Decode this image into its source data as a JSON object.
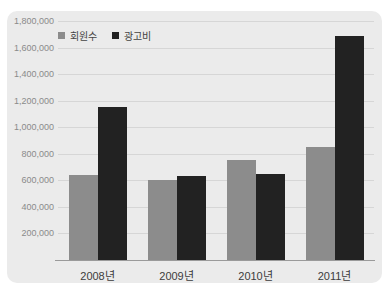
{
  "chart_data": {
    "type": "bar",
    "categories": [
      "2008년",
      "2009년",
      "2010년",
      "2011년"
    ],
    "series": [
      {
        "name": "회원수",
        "color": "#8c8c8c",
        "values": [
          640000,
          600000,
          750000,
          850000
        ]
      },
      {
        "name": "광고비",
        "color": "#222222",
        "values": [
          1150000,
          630000,
          650000,
          1690000
        ]
      }
    ],
    "title": "",
    "xlabel": "",
    "ylabel": "",
    "ylim": [
      0,
      1800000
    ],
    "ytick_interval": 200000,
    "ytick_labels": [
      "1,800,000",
      "1,600,000",
      "1,400,000",
      "1,200,000",
      "1,000,000",
      "800,000",
      "600,000",
      "400,000",
      "200,000"
    ],
    "grid": true,
    "legend_position": "top-left",
    "background_color": "#ebebeb",
    "gridline_color": "#d6d6d6",
    "axis_line_color": "#9a9a9a",
    "ytick_color": "#8a8a8a",
    "xtick_color": "#3c3c3c"
  }
}
